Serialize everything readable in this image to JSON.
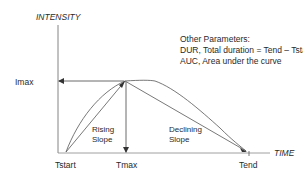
{
  "axes": {
    "y_label": "INTENSITY",
    "x_label": "TIME"
  },
  "markers": {
    "imax": "Imax",
    "tstart": "Tstart",
    "tmax": "Tmax",
    "tend": "Tend"
  },
  "annotations": {
    "rising_slope": [
      "Rising",
      "Slope"
    ],
    "declining_slope": [
      "Declining",
      "Slope"
    ]
  },
  "parameters": {
    "title": "Other Parameters:",
    "items": [
      "DUR, Total duration = Tend – Tstart",
      "AUC, Area under the curve"
    ]
  },
  "colors": {
    "line": "#555555",
    "text": "#2a2a2a",
    "background": "#ffffff"
  }
}
